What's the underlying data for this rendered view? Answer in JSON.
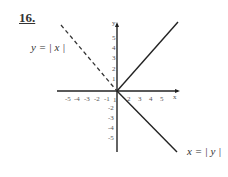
{
  "problem_number": "16.",
  "labels": {
    "dashed": "y = | x |",
    "solid": "x = | y |"
  },
  "axes": {
    "x_label": "x",
    "y_label": "y",
    "x_ticks": [
      "-5",
      "-4",
      "-3",
      "-2",
      "-1",
      "1",
      "2",
      "3",
      "4",
      "5"
    ],
    "y_ticks": [
      "5",
      "4",
      "3",
      "2",
      "1",
      "-1",
      "-2",
      "-3",
      "-4",
      "-5"
    ]
  }
}
